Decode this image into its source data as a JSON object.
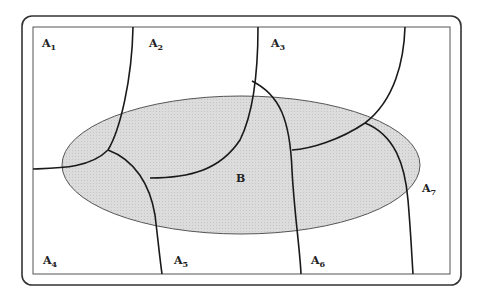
{
  "diagram": {
    "type": "partition-venn",
    "colors": {
      "frame": "#333333",
      "curve": "#1a1a1a",
      "ellipse_fill": "#d9d9d9",
      "ellipse_stroke": "#555555",
      "background": "#ffffff"
    },
    "partition_labels": [
      {
        "base": "A",
        "sub": "1",
        "x": 42,
        "y": 47
      },
      {
        "base": "A",
        "sub": "2",
        "x": 149,
        "y": 47
      },
      {
        "base": "A",
        "sub": "3",
        "x": 271,
        "y": 47
      },
      {
        "base": "A",
        "sub": "4",
        "x": 43,
        "y": 264
      },
      {
        "base": "A",
        "sub": "5",
        "x": 174,
        "y": 264
      },
      {
        "base": "A",
        "sub": "6",
        "x": 311,
        "y": 264
      },
      {
        "base": "A",
        "sub": "7",
        "x": 422,
        "y": 192
      }
    ],
    "event_label": {
      "text": "B",
      "x": 236,
      "y": 182
    }
  }
}
